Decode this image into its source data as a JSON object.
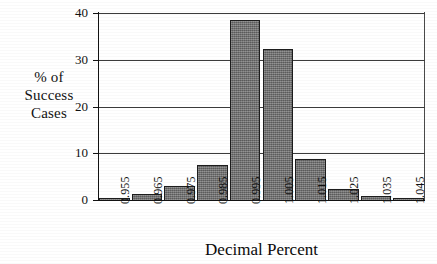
{
  "chart_data": {
    "type": "bar",
    "title": "",
    "subtitle": "",
    "xlabel": "Decimal Percent",
    "ylabel": "% of Success Cases",
    "ylabel_lines": [
      "% of",
      "Success",
      "Cases"
    ],
    "categories": [
      "0.955",
      "0.965",
      "0.975",
      "0.985",
      "0.995",
      "1.005",
      "1.015",
      "1.025",
      "1.035",
      "1.045"
    ],
    "values": [
      0.5,
      1.2,
      3.1,
      7.5,
      38.5,
      32.3,
      8.8,
      2.4,
      0.9,
      0.3
    ],
    "ylim": [
      0,
      40
    ],
    "yticks": [
      0,
      10,
      20,
      30,
      40
    ],
    "ytick_labels": [
      "0",
      "10",
      "20",
      "30",
      "40"
    ],
    "grid": true,
    "grid_axis": "y",
    "legend": false,
    "legend_position": "none",
    "bar_color": "#6f6f6f",
    "bar_edge_color": "#1d1d1d",
    "axis_color": "#121212",
    "grid_color": "#3c3c3c",
    "background_color": "#ffffff",
    "xtick_rotation": -90
  }
}
